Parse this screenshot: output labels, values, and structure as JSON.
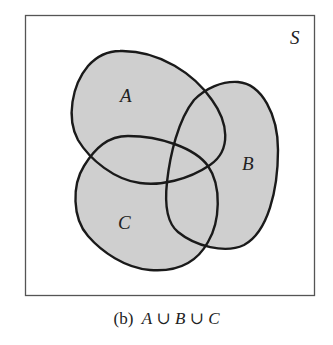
{
  "figure": {
    "universe_label": "S",
    "sets": [
      {
        "label": "A"
      },
      {
        "label": "B"
      },
      {
        "label": "C"
      }
    ],
    "shaded_region": "A ∪ B ∪ C",
    "fill_color": "#cfcfcf",
    "outline_color": "#1a1a1a"
  },
  "caption": {
    "prefix": "(b)",
    "set1": "A",
    "op1": "∪",
    "set2": "B",
    "op2": "∪",
    "set3": "C"
  }
}
